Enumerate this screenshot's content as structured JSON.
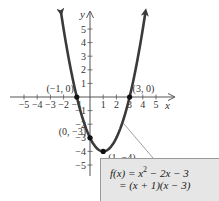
{
  "chart_data": {
    "type": "line",
    "title": "",
    "function": "f(x) = x^2 - 2x - 3",
    "xlabel": "x",
    "ylabel": "y",
    "xlim": [
      -5.5,
      5.5
    ],
    "ylim": [
      -5.5,
      6
    ],
    "x_ticks": [
      -5,
      -4,
      -3,
      -2,
      -1,
      1,
      2,
      3,
      4,
      5
    ],
    "y_ticks": [
      -5,
      -4,
      -3,
      -2,
      -1,
      1,
      2,
      3,
      4,
      5
    ],
    "x_tick_labels": [
      "−5",
      "−4",
      "−3",
      "−2",
      "−1",
      "1",
      "2",
      "3",
      "4",
      "5"
    ],
    "y_tick_labels": [
      "−5",
      "−4",
      "−3",
      "−2",
      "−1",
      "1",
      "2",
      "3",
      "4",
      "5"
    ],
    "curve_x_range": [
      -2.2,
      4.2
    ],
    "points": [
      {
        "x": -1,
        "y": 0,
        "label": "(−1, 0)"
      },
      {
        "x": 3,
        "y": 0,
        "label": "(3, 0)"
      },
      {
        "x": 0,
        "y": -3,
        "label": "(0, −3)"
      },
      {
        "x": 1,
        "y": -4,
        "label": "(1, −4)"
      }
    ],
    "grid": false,
    "annotation": {
      "line1_prefix": "f(x) = x",
      "line1_exp": "2",
      "line1_suffix": " − 2x − 3",
      "line2": "= (x + 1)(x − 3)"
    }
  },
  "colors": {
    "curve": "#3a3a3a",
    "axis": "#555555",
    "box_fill": "#e6e6e6",
    "box_border": "#9a9a9a"
  }
}
